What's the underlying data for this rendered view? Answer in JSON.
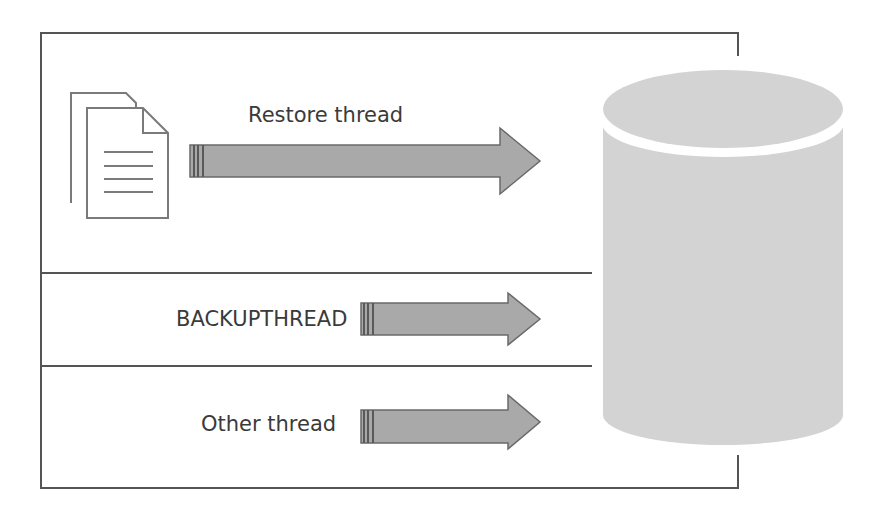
{
  "diagram": {
    "threads": [
      {
        "label": "Restore thread",
        "kind": "restore"
      },
      {
        "label": "BACKUPTHREAD",
        "kind": "backup"
      },
      {
        "label": "Other thread",
        "kind": "other"
      }
    ],
    "icons": {
      "source": "documents-icon",
      "target": "database-cylinder-icon"
    },
    "colors": {
      "arrow_fill": "#a9a9a9",
      "arrow_stroke": "#5a5a5a",
      "cylinder_fill": "#d3d3d3",
      "line": "#555555",
      "text": "#3a3a3a"
    }
  }
}
